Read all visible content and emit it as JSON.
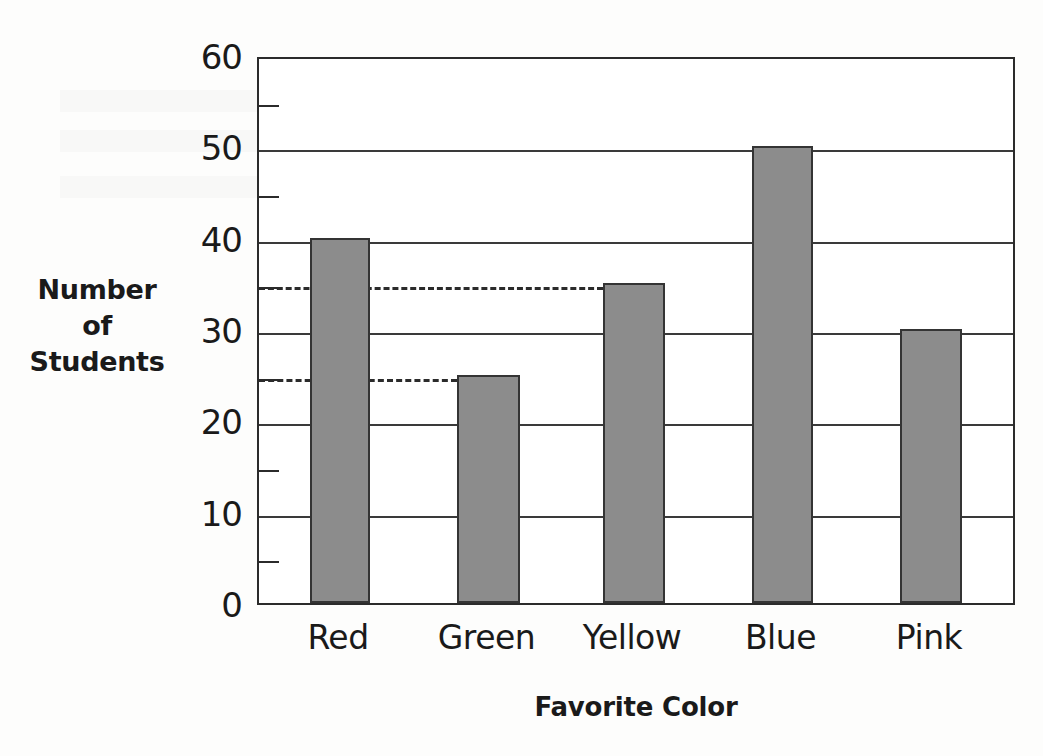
{
  "chart_data": {
    "type": "bar",
    "title": "",
    "xlabel": "Favorite Color",
    "ylabel": "Number of Students",
    "ylabel_lines": [
      "Number",
      "of",
      "Students"
    ],
    "categories": [
      "Red",
      "Green",
      "Yellow",
      "Blue",
      "Pink"
    ],
    "values": [
      40,
      25,
      35,
      50,
      30
    ],
    "ylim": [
      0,
      60
    ],
    "y_major_ticks": [
      0,
      10,
      20,
      30,
      40,
      50,
      60
    ],
    "y_major_tick_labels": [
      "0",
      "10",
      "20",
      "30",
      "40",
      "50",
      "60"
    ],
    "y_minor_ticks": [
      5,
      15,
      25,
      35,
      45,
      55
    ],
    "grid": "horizontal-major",
    "legend": "none",
    "annotations": [
      {
        "name": "dashed-guide-35",
        "value": 35,
        "style": "dashed",
        "spans": "axis to Yellow bar"
      },
      {
        "name": "dashed-guide-25",
        "value": 25,
        "style": "dashed",
        "spans": "axis to Green bar"
      }
    ],
    "bar_color": "#8c8c8c",
    "bar_edge_color": "#343434",
    "axis_color": "#2b2b2b"
  },
  "chart": {
    "bars": [
      {
        "label": "Red",
        "value": 40,
        "x": 51,
        "width": 60
      },
      {
        "label": "Green",
        "value": 25,
        "x": 198,
        "width": 63
      },
      {
        "label": "Yellow",
        "value": 35,
        "x": 344,
        "width": 62
      },
      {
        "label": "Blue",
        "value": 50,
        "x": 493,
        "width": 61
      },
      {
        "label": "Pink",
        "value": 30,
        "x": 641,
        "width": 62
      }
    ],
    "dashes": [
      {
        "value": 35,
        "width": 344
      },
      {
        "value": 25,
        "width": 198
      }
    ]
  }
}
